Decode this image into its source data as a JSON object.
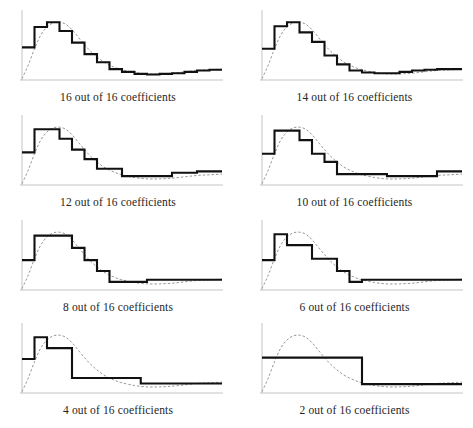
{
  "figure": {
    "name": "progressive-wavelet-reconstruction",
    "background_color": "#ffffff",
    "axis_color": "#b4b4b4",
    "step_color": "#111111",
    "reference_color": "#8a8a8a",
    "caption_color": "#252525",
    "rows": 4,
    "columns": 2
  },
  "panels": [
    {
      "id": "panel-16",
      "caption": "16 out of 16 coefficients",
      "coefficients_kept": 16,
      "coefficients_total": 16
    },
    {
      "id": "panel-14",
      "caption": "14 out of 16 coefficients",
      "coefficients_kept": 14,
      "coefficients_total": 16
    },
    {
      "id": "panel-12",
      "caption": "12 out of 16 coefficients",
      "coefficients_kept": 12,
      "coefficients_total": 16
    },
    {
      "id": "panel-10",
      "caption": "10 out of 16 coefficients",
      "coefficients_kept": 10,
      "coefficients_total": 16
    },
    {
      "id": "panel-8",
      "caption": "8 out of 16 coefficients",
      "coefficients_kept": 8,
      "coefficients_total": 16
    },
    {
      "id": "panel-6",
      "caption": "6 out of 16 coefficients",
      "coefficients_kept": 6,
      "coefficients_total": 16
    },
    {
      "id": "panel-4",
      "caption": "4 out of 16 coefficients",
      "coefficients_kept": 4,
      "coefficients_total": 16
    },
    {
      "id": "panel-2",
      "caption": "2 out of 16 coefficients",
      "coefficients_kept": 2,
      "coefficients_total": 16
    }
  ],
  "chart_data": [
    {
      "type": "line",
      "title": "16 out of 16 coefficients",
      "xlabel": "",
      "ylabel": "",
      "xlim": [
        0,
        64
      ],
      "ylim": [
        0,
        1.0
      ],
      "grid": false,
      "legend": "none",
      "series": [
        {
          "name": "reference-curve",
          "style": "dashed",
          "x": [
            0,
            2,
            4,
            6,
            8,
            10,
            12,
            14,
            16,
            18,
            20,
            22,
            24,
            26,
            28,
            30,
            32,
            36,
            40,
            44,
            48,
            52,
            56,
            60,
            64
          ],
          "y": [
            0.02,
            0.22,
            0.46,
            0.66,
            0.78,
            0.84,
            0.85,
            0.82,
            0.74,
            0.63,
            0.52,
            0.42,
            0.34,
            0.27,
            0.22,
            0.18,
            0.15,
            0.11,
            0.09,
            0.09,
            0.1,
            0.12,
            0.14,
            0.15,
            0.16
          ]
        },
        {
          "name": "haar-step-approximation",
          "style": "step",
          "x": [
            0,
            4,
            8,
            12,
            16,
            20,
            24,
            28,
            32,
            36,
            40,
            44,
            48,
            52,
            56,
            60,
            64
          ],
          "y": [
            0.48,
            0.78,
            0.85,
            0.72,
            0.55,
            0.38,
            0.26,
            0.16,
            0.12,
            0.09,
            0.08,
            0.09,
            0.1,
            0.12,
            0.14,
            0.15,
            0.15
          ]
        }
      ]
    },
    {
      "type": "line",
      "title": "14 out of 16 coefficients",
      "xlabel": "",
      "ylabel": "",
      "xlim": [
        0,
        64
      ],
      "ylim": [
        0,
        1.0
      ],
      "grid": false,
      "legend": "none",
      "series": [
        {
          "name": "reference-curve",
          "style": "dashed",
          "x": [
            0,
            2,
            4,
            6,
            8,
            10,
            12,
            14,
            16,
            18,
            20,
            22,
            24,
            26,
            28,
            30,
            32,
            36,
            40,
            44,
            48,
            52,
            56,
            60,
            64
          ],
          "y": [
            0.02,
            0.22,
            0.46,
            0.66,
            0.78,
            0.84,
            0.85,
            0.82,
            0.74,
            0.63,
            0.52,
            0.42,
            0.34,
            0.27,
            0.22,
            0.18,
            0.15,
            0.11,
            0.09,
            0.09,
            0.1,
            0.12,
            0.14,
            0.15,
            0.16
          ]
        },
        {
          "name": "haar-step-approximation",
          "style": "step",
          "x": [
            0,
            4,
            8,
            12,
            16,
            20,
            24,
            28,
            32,
            36,
            40,
            44,
            48,
            52,
            56,
            60,
            64
          ],
          "y": [
            0.46,
            0.79,
            0.85,
            0.7,
            0.56,
            0.36,
            0.23,
            0.14,
            0.11,
            0.1,
            0.1,
            0.12,
            0.14,
            0.15,
            0.16,
            0.16,
            0.16
          ]
        }
      ]
    },
    {
      "type": "line",
      "title": "12 out of 16 coefficients",
      "xlabel": "",
      "ylabel": "",
      "xlim": [
        0,
        64
      ],
      "ylim": [
        0,
        1.0
      ],
      "grid": false,
      "legend": "none",
      "series": [
        {
          "name": "reference-curve",
          "style": "dashed",
          "x": [
            0,
            2,
            4,
            6,
            8,
            10,
            12,
            14,
            16,
            18,
            20,
            22,
            24,
            26,
            28,
            30,
            32,
            36,
            40,
            44,
            48,
            52,
            56,
            60,
            64
          ],
          "y": [
            0.02,
            0.22,
            0.46,
            0.66,
            0.78,
            0.84,
            0.85,
            0.82,
            0.74,
            0.63,
            0.52,
            0.42,
            0.34,
            0.27,
            0.22,
            0.18,
            0.15,
            0.11,
            0.09,
            0.09,
            0.1,
            0.12,
            0.14,
            0.15,
            0.16
          ]
        },
        {
          "name": "haar-step-approximation",
          "style": "step",
          "x": [
            0,
            4,
            8,
            12,
            16,
            20,
            24,
            28,
            32,
            40,
            48,
            56,
            64
          ],
          "y": [
            0.48,
            0.82,
            0.82,
            0.68,
            0.52,
            0.38,
            0.24,
            0.24,
            0.13,
            0.13,
            0.18,
            0.2,
            0.2
          ]
        }
      ]
    },
    {
      "type": "line",
      "title": "10 out of 16 coefficients",
      "xlabel": "",
      "ylabel": "",
      "xlim": [
        0,
        64
      ],
      "ylim": [
        0,
        1.0
      ],
      "grid": false,
      "legend": "none",
      "series": [
        {
          "name": "reference-curve",
          "style": "dashed",
          "x": [
            0,
            2,
            4,
            6,
            8,
            10,
            12,
            14,
            16,
            18,
            20,
            22,
            24,
            26,
            28,
            30,
            32,
            36,
            40,
            44,
            48,
            52,
            56,
            60,
            64
          ],
          "y": [
            0.02,
            0.22,
            0.46,
            0.66,
            0.78,
            0.84,
            0.85,
            0.82,
            0.74,
            0.63,
            0.52,
            0.42,
            0.34,
            0.27,
            0.22,
            0.18,
            0.15,
            0.11,
            0.09,
            0.09,
            0.1,
            0.12,
            0.14,
            0.15,
            0.16
          ]
        },
        {
          "name": "haar-step-approximation",
          "style": "step",
          "x": [
            0,
            4,
            8,
            12,
            16,
            20,
            24,
            32,
            40,
            48,
            56,
            64
          ],
          "y": [
            0.46,
            0.8,
            0.8,
            0.66,
            0.46,
            0.34,
            0.16,
            0.16,
            0.13,
            0.13,
            0.2,
            0.2
          ]
        }
      ]
    },
    {
      "type": "line",
      "title": "8 out of 16 coefficients",
      "xlabel": "",
      "ylabel": "",
      "xlim": [
        0,
        64
      ],
      "ylim": [
        0,
        1.0
      ],
      "grid": false,
      "legend": "none",
      "series": [
        {
          "name": "reference-curve",
          "style": "dashed",
          "x": [
            0,
            2,
            4,
            6,
            8,
            10,
            12,
            14,
            16,
            18,
            20,
            22,
            24,
            26,
            28,
            30,
            32,
            36,
            40,
            44,
            48,
            52,
            56,
            60,
            64
          ],
          "y": [
            0.02,
            0.22,
            0.46,
            0.66,
            0.78,
            0.84,
            0.85,
            0.82,
            0.74,
            0.63,
            0.52,
            0.42,
            0.34,
            0.27,
            0.22,
            0.18,
            0.15,
            0.11,
            0.09,
            0.09,
            0.1,
            0.12,
            0.14,
            0.15,
            0.16
          ]
        },
        {
          "name": "haar-step-approximation",
          "style": "step",
          "x": [
            0,
            4,
            8,
            16,
            20,
            24,
            28,
            32,
            40,
            64
          ],
          "y": [
            0.44,
            0.8,
            0.8,
            0.62,
            0.44,
            0.28,
            0.12,
            0.12,
            0.15,
            0.15
          ]
        }
      ]
    },
    {
      "type": "line",
      "title": "6 out of 16 coefficients",
      "xlabel": "",
      "ylabel": "",
      "xlim": [
        0,
        64
      ],
      "ylim": [
        0,
        1.0
      ],
      "grid": false,
      "legend": "none",
      "series": [
        {
          "name": "reference-curve",
          "style": "dashed",
          "x": [
            0,
            2,
            4,
            6,
            8,
            10,
            12,
            14,
            16,
            18,
            20,
            22,
            24,
            26,
            28,
            30,
            32,
            36,
            40,
            44,
            48,
            52,
            56,
            60,
            64
          ],
          "y": [
            0.02,
            0.22,
            0.46,
            0.66,
            0.78,
            0.84,
            0.85,
            0.82,
            0.74,
            0.63,
            0.52,
            0.42,
            0.34,
            0.27,
            0.22,
            0.18,
            0.15,
            0.11,
            0.09,
            0.09,
            0.1,
            0.12,
            0.14,
            0.15,
            0.16
          ]
        },
        {
          "name": "haar-step-approximation",
          "style": "step",
          "x": [
            0,
            4,
            8,
            16,
            24,
            28,
            32,
            64
          ],
          "y": [
            0.44,
            0.82,
            0.66,
            0.46,
            0.28,
            0.12,
            0.15,
            0.15
          ]
        }
      ]
    },
    {
      "type": "line",
      "title": "4 out of 16 coefficients",
      "xlabel": "",
      "ylabel": "",
      "xlim": [
        0,
        64
      ],
      "ylim": [
        0,
        1.0
      ],
      "grid": false,
      "legend": "none",
      "series": [
        {
          "name": "reference-curve",
          "style": "dashed",
          "x": [
            0,
            2,
            4,
            6,
            8,
            10,
            12,
            14,
            16,
            18,
            20,
            22,
            24,
            26,
            28,
            30,
            32,
            36,
            40,
            44,
            48,
            52,
            56,
            60,
            64
          ],
          "y": [
            0.02,
            0.22,
            0.46,
            0.66,
            0.78,
            0.84,
            0.85,
            0.82,
            0.74,
            0.63,
            0.52,
            0.42,
            0.34,
            0.27,
            0.22,
            0.18,
            0.15,
            0.11,
            0.09,
            0.09,
            0.1,
            0.12,
            0.14,
            0.15,
            0.16
          ]
        },
        {
          "name": "haar-step-approximation",
          "style": "step",
          "x": [
            0,
            4,
            8,
            10,
            16,
            22,
            38,
            64
          ],
          "y": [
            0.5,
            0.82,
            0.66,
            0.66,
            0.22,
            0.22,
            0.14,
            0.14
          ]
        }
      ]
    },
    {
      "type": "line",
      "title": "2 out of 16 coefficients",
      "xlabel": "",
      "ylabel": "",
      "xlim": [
        0,
        64
      ],
      "ylim": [
        0,
        1.0
      ],
      "grid": false,
      "legend": "none",
      "series": [
        {
          "name": "reference-curve",
          "style": "dashed",
          "x": [
            0,
            2,
            4,
            6,
            8,
            10,
            12,
            14,
            16,
            18,
            20,
            22,
            24,
            26,
            28,
            30,
            32,
            36,
            40,
            44,
            48,
            52,
            56,
            60,
            64
          ],
          "y": [
            0.02,
            0.22,
            0.46,
            0.66,
            0.78,
            0.84,
            0.85,
            0.82,
            0.74,
            0.63,
            0.52,
            0.42,
            0.34,
            0.27,
            0.22,
            0.18,
            0.15,
            0.11,
            0.09,
            0.09,
            0.1,
            0.12,
            0.14,
            0.15,
            0.16
          ]
        },
        {
          "name": "haar-step-approximation",
          "style": "step",
          "x": [
            0,
            32,
            64
          ],
          "y": [
            0.52,
            0.13,
            0.13
          ]
        }
      ]
    }
  ]
}
